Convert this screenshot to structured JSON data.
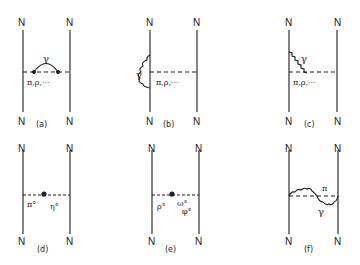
{
  "diagram": {
    "nucleon_label": "N",
    "panels": [
      {
        "id": "a",
        "caption": "(a)",
        "photon_label": "γ",
        "exchange_label": "π,ρ,···",
        "description": "photon attached to exchanged meson line"
      },
      {
        "id": "b",
        "caption": "(b)",
        "photon_label": "γ",
        "exchange_label": "π,ρ,···",
        "description": "photon self-energy on nucleon line"
      },
      {
        "id": "c",
        "caption": "(c)",
        "photon_label": "γ",
        "exchange_label": "π,ρ,···",
        "description": "photon from nucleon to meson-nucleon vertex"
      },
      {
        "id": "d",
        "caption": "(d)",
        "left_label": "π°",
        "right_label": "η°",
        "description": "π0-η0 mixing"
      },
      {
        "id": "e",
        "caption": "(e)",
        "left_label": "ρ°",
        "right_label_top": "ω°",
        "right_label_bottom": "φ°",
        "description": "ρ0-ω0/φ0 mixing"
      },
      {
        "id": "f",
        "caption": "(f)",
        "meson_label": "π",
        "photon_label": "γ",
        "description": "π and γ exchange"
      }
    ]
  }
}
